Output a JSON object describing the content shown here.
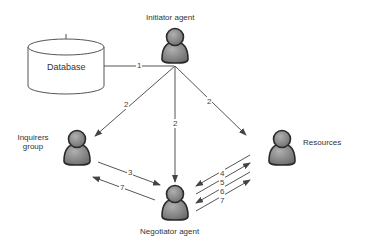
{
  "diagram": {
    "nodes": {
      "database": {
        "label": "Database"
      },
      "initiator": {
        "label": "Initiator agent"
      },
      "inquirers": {
        "label_line1": "Inquirers",
        "label_line2": "group"
      },
      "negotiator": {
        "label": "Negotiator agent"
      },
      "resources": {
        "label": "Resources"
      }
    },
    "edges": [
      {
        "from": "database",
        "to": "initiator",
        "label": "1"
      },
      {
        "from": "initiator",
        "to": "inquirers",
        "label": "2"
      },
      {
        "from": "initiator",
        "to": "negotiator",
        "label": "2"
      },
      {
        "from": "initiator",
        "to": "resources",
        "label": "2"
      },
      {
        "from": "inquirers",
        "to": "negotiator",
        "label": "3"
      },
      {
        "from": "negotiator",
        "to": "inquirers",
        "label": "7"
      },
      {
        "from": "resources",
        "to": "negotiator",
        "label": "4"
      },
      {
        "from": "negotiator",
        "to": "resources",
        "label": "5"
      },
      {
        "from": "resources",
        "to": "negotiator",
        "label": "6"
      },
      {
        "from": "negotiator",
        "to": "resources",
        "label": "7"
      }
    ],
    "colors": {
      "line": "#555555",
      "person_fill": "#8a8a8a",
      "person_outline": "#2a2a2a",
      "text": "#333333"
    }
  }
}
